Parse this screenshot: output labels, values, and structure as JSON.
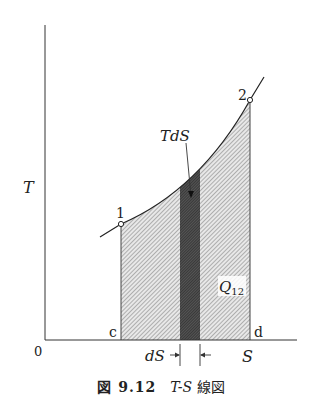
{
  "diagram": {
    "type": "T-S diagram",
    "axes": {
      "y_label": "T",
      "x_label": "S",
      "origin_label": "0"
    },
    "points": [
      {
        "label": "1",
        "x": 121,
        "y": 224
      },
      {
        "label": "2",
        "x": 250,
        "y": 100
      }
    ],
    "base_labels": {
      "left": "c",
      "right": "d"
    },
    "annotations": {
      "strip_label": "TdS",
      "area_label_main": "Q",
      "area_label_sub": "12",
      "width_label": "dS"
    },
    "colors": {
      "line": "#333333",
      "hatch_light": "#9a9a9a",
      "hatch_dark": "#3a3a3a",
      "background": "#ffffff"
    }
  },
  "caption": {
    "figure_number": "図 9.12",
    "title_math": "T-S",
    "title_text": "線図"
  }
}
